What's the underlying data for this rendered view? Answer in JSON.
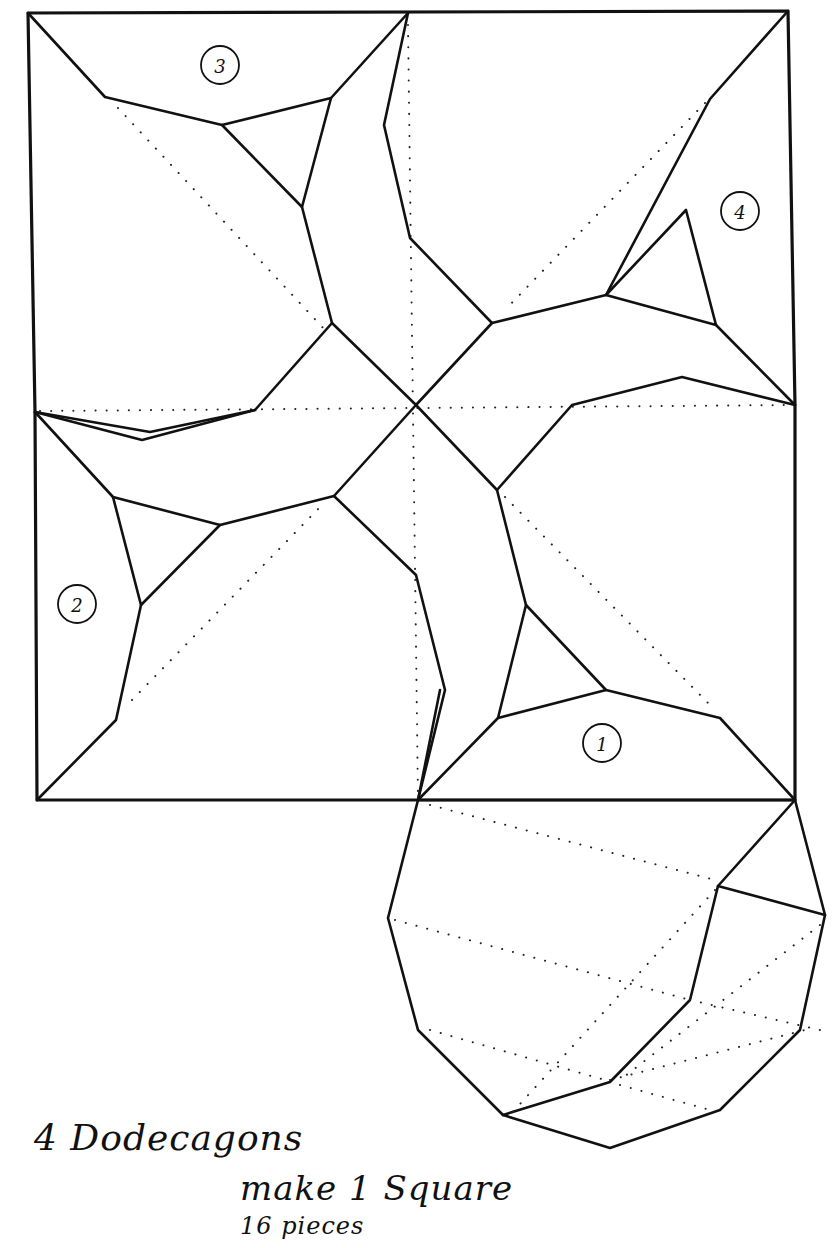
{
  "title": {
    "line1": "4 Dodecagons",
    "line2": "make 1 Square",
    "line3": "16 pieces"
  },
  "piece_labels": [
    {
      "id": "piece-1",
      "text": "1",
      "cx": 602,
      "cy": 743
    },
    {
      "id": "piece-2",
      "text": "2",
      "cx": 77,
      "cy": 604
    },
    {
      "id": "piece-3",
      "text": "3",
      "cx": 220,
      "cy": 65
    },
    {
      "id": "piece-4",
      "text": "4",
      "cx": 740,
      "cy": 211
    }
  ],
  "diagram": {
    "square": {
      "x1": 28,
      "y1": 13,
      "x2": 795,
      "y2": 800
    },
    "stroke_color": "#111111",
    "background_color": "#ffffff"
  }
}
